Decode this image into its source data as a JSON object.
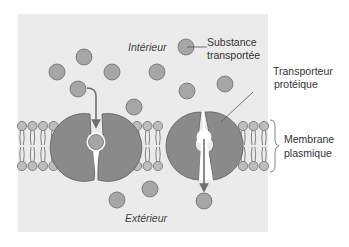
{
  "diagram": {
    "labels": {
      "interior": "Intérieur",
      "exterior": "Extérieur",
      "substance_line1": "Substance",
      "substance_line2": "transportée",
      "transporter_line1": "Transporteur",
      "transporter_line2": "protéique",
      "membrane_line1": "Membrane",
      "membrane_line2": "plasmique"
    },
    "colors": {
      "background_panel": "#ebebeb",
      "molecule_fill": "#a6a6a6",
      "molecule_stroke": "#6e6e6e",
      "protein_fill": "#8a8a8a",
      "protein_stroke": "#5e5e5e",
      "arrow": "#6e6e6e",
      "lipid_head": "#bdbdbd",
      "text": "#333333"
    },
    "elements": {
      "molecules_interior_count": 9,
      "molecules_exterior_count": 3,
      "transporters": [
        {
          "state": "open-to-interior",
          "direction": "inward binding"
        },
        {
          "state": "open-to-exterior",
          "direction": "release outward"
        }
      ]
    }
  }
}
